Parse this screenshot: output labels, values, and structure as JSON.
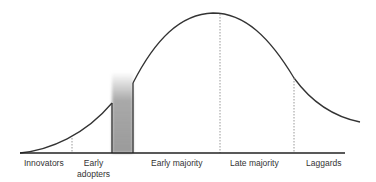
{
  "diagram": {
    "colors": {
      "curve": "#333333",
      "baseline": "#222222",
      "divider": "#999999",
      "chasm": "#9a9a9a"
    },
    "segments": [
      {
        "label": "Innovators"
      },
      {
        "label": "Early",
        "label2": "adopters"
      },
      {
        "label": "Early majority"
      },
      {
        "label": "Late majority"
      },
      {
        "label": "Laggards"
      }
    ],
    "chasm_label": "chasm gap"
  }
}
